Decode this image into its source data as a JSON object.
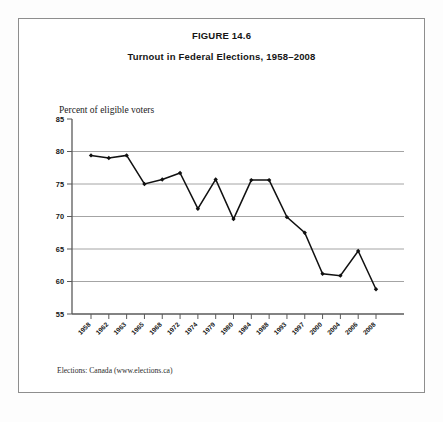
{
  "figure": {
    "number_label": "FIGURE 14.6",
    "subtitle": "Turnout in Federal Elections, 1958–2008",
    "axis_caption": "Percent of eligible voters",
    "source": "Elections: Canada  (www.elections.ca)"
  },
  "chart_data": {
    "type": "line",
    "title": "Turnout in Federal Elections, 1958–2008",
    "subtitle": "FIGURE 14.6",
    "xlabel": "",
    "ylabel": "Percent of eligible voters",
    "ylim": [
      55,
      85
    ],
    "ytick_step": 5,
    "yticks": [
      55,
      60,
      65,
      70,
      75,
      80,
      85
    ],
    "grid": true,
    "grid_axis": "y",
    "legend": false,
    "marker": "diamond",
    "line_color": "#111111",
    "grid_color": "#9a9a9a",
    "categories": [
      "1958",
      "1962",
      "1963",
      "1965",
      "1968",
      "1972",
      "1974",
      "1979",
      "1980",
      "1984",
      "1988",
      "1993",
      "1997",
      "2000",
      "2004",
      "2006",
      "2008"
    ],
    "values": [
      79.4,
      79.0,
      79.4,
      75.0,
      75.7,
      76.7,
      71.2,
      75.7,
      69.6,
      75.6,
      75.6,
      69.9,
      67.5,
      61.2,
      60.9,
      64.7,
      58.8
    ],
    "series": [
      {
        "name": "Turnout",
        "values": [
          79.4,
          79.0,
          79.4,
          75.0,
          75.7,
          76.7,
          71.2,
          75.7,
          69.6,
          75.6,
          75.6,
          69.9,
          67.5,
          61.2,
          60.9,
          64.7,
          58.8
        ]
      }
    ]
  }
}
